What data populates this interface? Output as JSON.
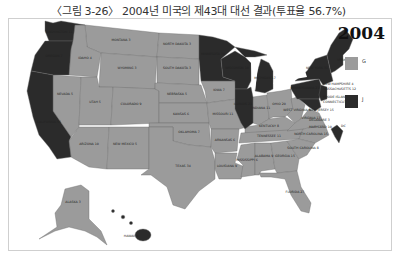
{
  "caption": "〈그림 3-26〉 2004년 미국의 제43대 대선 결과(투표율 56.7%)",
  "year": "2004",
  "colors": {
    "G": "#9b9b9b",
    "J": "#2b2b2b",
    "border": "#6d6d6d"
  },
  "legend": [
    {
      "key": "G",
      "label": "G",
      "color": "#9b9b9b"
    },
    {
      "key": "J",
      "label": "J",
      "color": "#2b2b2b"
    }
  ],
  "states": [
    {
      "name": "WASHINGTON",
      "ev": "11",
      "winner": "J"
    },
    {
      "name": "OREGON",
      "ev": "7",
      "winner": "J"
    },
    {
      "name": "CALIFORNIA",
      "ev": "55",
      "winner": "J"
    },
    {
      "name": "MONTANA",
      "ev": "3",
      "winner": "G"
    },
    {
      "name": "IDAHO",
      "ev": "4",
      "winner": "G"
    },
    {
      "name": "NEVADA",
      "ev": "5",
      "winner": "G"
    },
    {
      "name": "WYOMING",
      "ev": "3",
      "winner": "G"
    },
    {
      "name": "UTAH",
      "ev": "5",
      "winner": "G"
    },
    {
      "name": "COLORADO",
      "ev": "9",
      "winner": "G"
    },
    {
      "name": "ARIZONA",
      "ev": "10",
      "winner": "G"
    },
    {
      "name": "NEW MEXICO",
      "ev": "5",
      "winner": "G"
    },
    {
      "name": "NORTH DAKOTA",
      "ev": "3",
      "winner": "G"
    },
    {
      "name": "SOUTH DAKOTA",
      "ev": "3",
      "winner": "G"
    },
    {
      "name": "NEBRASKA",
      "ev": "5",
      "winner": "G"
    },
    {
      "name": "KANSAS",
      "ev": "6",
      "winner": "G"
    },
    {
      "name": "OKLAHOMA",
      "ev": "7",
      "winner": "G"
    },
    {
      "name": "TEXAS",
      "ev": "34",
      "winner": "G"
    },
    {
      "name": "MINNESOTA",
      "ev": "10",
      "winner": "J"
    },
    {
      "name": "IOWA",
      "ev": "7",
      "winner": "G"
    },
    {
      "name": "MISSOURI",
      "ev": "11",
      "winner": "G"
    },
    {
      "name": "ARKANSAS",
      "ev": "6",
      "winner": "G"
    },
    {
      "name": "LOUISIANA",
      "ev": "9",
      "winner": "G"
    },
    {
      "name": "WISCONSIN",
      "ev": "10",
      "winner": "J"
    },
    {
      "name": "ILLINOIS",
      "ev": "21",
      "winner": "J"
    },
    {
      "name": "MICHIGAN",
      "ev": "17",
      "winner": "J"
    },
    {
      "name": "INDIANA",
      "ev": "11",
      "winner": "G"
    },
    {
      "name": "OHIO",
      "ev": "20",
      "winner": "G"
    },
    {
      "name": "KENTUCKY",
      "ev": "8",
      "winner": "G"
    },
    {
      "name": "TENNESSEE",
      "ev": "11",
      "winner": "G"
    },
    {
      "name": "MISSISSIPPI",
      "ev": "6",
      "winner": "G"
    },
    {
      "name": "ALABAMA",
      "ev": "9",
      "winner": "G"
    },
    {
      "name": "GEORGIA",
      "ev": "15",
      "winner": "G"
    },
    {
      "name": "FLORIDA",
      "ev": "27",
      "winner": "G"
    },
    {
      "name": "SOUTH CAROLINA",
      "ev": "8",
      "winner": "G"
    },
    {
      "name": "NORTH CAROLINA",
      "ev": "15",
      "winner": "G"
    },
    {
      "name": "VIRGINIA",
      "ev": "13",
      "winner": "G"
    },
    {
      "name": "WEST VIRGINIA",
      "ev": "5",
      "winner": "G"
    },
    {
      "name": "PENNSYLVANIA",
      "ev": "21",
      "winner": "J"
    },
    {
      "name": "NEW YORK",
      "ev": "31",
      "winner": "J"
    },
    {
      "name": "VERMONT",
      "ev": "3",
      "winner": "J"
    },
    {
      "name": "NEW HAMPSHIRE",
      "ev": "4",
      "winner": "J"
    },
    {
      "name": "MAINE",
      "ev": "4",
      "winner": "J"
    },
    {
      "name": "MASSACHUSETTS",
      "ev": "12",
      "winner": "J"
    },
    {
      "name": "RHODE ISLAND",
      "ev": "4",
      "winner": "J"
    },
    {
      "name": "CONNECTICUT",
      "ev": "7",
      "winner": "J"
    },
    {
      "name": "NEW JERSEY",
      "ev": "15",
      "winner": "J"
    },
    {
      "name": "DELAWARE",
      "ev": "3",
      "winner": "J"
    },
    {
      "name": "MARYLAND",
      "ev": "10",
      "winner": "J"
    },
    {
      "name": "DC",
      "ev": "3",
      "winner": "J"
    },
    {
      "name": "ALASKA",
      "ev": "3",
      "winner": "G"
    },
    {
      "name": "HAWAII",
      "ev": "4",
      "winner": "J"
    }
  ],
  "labels": {
    "WA": "WASHINGTON 11",
    "OR": "OREGON 7",
    "CA": "CALIFORNIA 55",
    "MT": "MONTANA 3",
    "ID": "IDAHO 4",
    "NV": "NEVADA 5",
    "WY": "WYOMING 3",
    "UT": "UTAH 5",
    "CO": "COLORADO 9",
    "AZ": "ARIZONA 10",
    "NM": "NEW MEXICO 5",
    "ND": "NORTH DAKOTA 3",
    "SD": "SOUTH DAKOTA 3",
    "NE": "NEBRASKA 5",
    "KS": "KANSAS 6",
    "OK": "OKLAHOMA 7",
    "TX": "TEXAS 34",
    "MN": "MINNESOTA 10",
    "IA": "IOWA 7",
    "MO": "MISSOURI 11",
    "AR": "ARKANSAS 6",
    "LA": "LOUISIANA 9",
    "WI": "WISCONSIN 10",
    "IL": "ILLINOIS 21",
    "MI": "MICHIGAN 17",
    "IN": "INDIANA 11",
    "OH": "OHIO 20",
    "KY": "KENTUCKY 8",
    "TN": "TENNESSEE 11",
    "MS": "MISSISSIPPI 6",
    "AL": "ALABAMA 9",
    "GA": "GEORGIA 15",
    "FL": "FLORIDA 27",
    "SC": "SOUTH CAROLINA 8",
    "NC": "NORTH CAROLINA 15",
    "VA": "VIRGINIA 13",
    "WV": "WEST VIRGINIA 5",
    "PA": "PENNSYLVANIA 21",
    "NY": "NEW YORK 31",
    "VT": "VERMONT 3",
    "NH": "NEW HAMPSHIRE 4",
    "MA": "MASSACHUSETTS 12",
    "RI": "RHODE ISLAND 4",
    "CT": "CONNECTICUT 7",
    "NJ": "NEW JERSEY 15",
    "DE": "DELAWARE 3",
    "MD": "MARYLAND 10",
    "DC": "DC",
    "AK": "ALASKA 3",
    "HI": "HAWAII 4"
  }
}
